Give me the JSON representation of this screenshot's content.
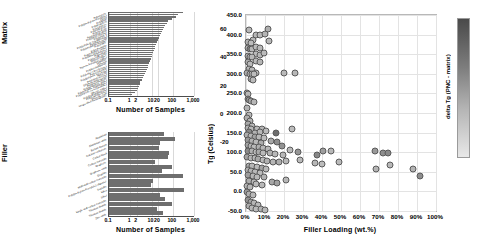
{
  "chart_data": [
    {
      "type": "bar",
      "orientation": "horizontal",
      "title": "Matrix",
      "xlabel": "Number of Samples",
      "ylabel": "Matrix",
      "xscale": "log",
      "xlim": [
        0.1,
        1000
      ],
      "xticks": [
        "0.1",
        "1",
        "2",
        "10",
        "20",
        "100",
        "1,000"
      ],
      "xtickvalues": [
        0.1,
        1,
        2,
        10,
        20,
        100,
        1000
      ],
      "grid": true,
      "bar_color": "#6e6e6e",
      "categories": [
        "Polystyrene",
        "Poly(methyl methacrylate)",
        "Epoxy",
        "Polyimide",
        "Polypropylene",
        "Polyethylene",
        "Polycarbonate",
        "Polyurethane",
        "Poly(vinyl alcohol)",
        "Poly(vinyl chloride)",
        "Polyamide 6",
        "Poly(ethylene terephthalate)",
        "Poly(lactic acid)",
        "Poly(vinylidene fluoride)",
        "Polyaniline",
        "Polyetherimide",
        "Poly(ethylene oxide)",
        "Poly(dimethylsiloxane)",
        "Polysulfone",
        "Poly(acrylic acid)",
        "Natural rubber",
        "Styrene-butadiene rubber",
        "Cellulose",
        "Chitosan",
        "Polybenzimidazole",
        "Poly(ether ether ketone)",
        "Polyacrylonitrile",
        "Poly(butylene succinate)",
        "Nylon 66",
        "Poly(vinyl acetate)",
        "Ethylene-vinyl acetate",
        "Polyphenylsulfone",
        "Poly(propylene oxide)",
        "Poly(ethylene naphthalate)",
        "Poly(styrene-co-acrylonitrile)",
        "Silicone rubber",
        "Poly(hydroxybutyrate)",
        "Poly(caprolactone)",
        "Phenolic resin",
        "Unspecified thermoplastic"
      ],
      "values": [
        310,
        170,
        150,
        95,
        60,
        55,
        44,
        38,
        33,
        30,
        27,
        24,
        22,
        20,
        18,
        16,
        15,
        14,
        13,
        12,
        11,
        10,
        9,
        8.5,
        8,
        7,
        6.5,
        6,
        5.5,
        5,
        4.5,
        4,
        3.5,
        3,
        2.8,
        2.5,
        2.2,
        2,
        1.6,
        1.2
      ]
    },
    {
      "type": "bar",
      "orientation": "horizontal",
      "title": "Filler",
      "xlabel": "Number of Samples",
      "ylabel": "Filler",
      "xscale": "log",
      "xlim": [
        0.1,
        1000
      ],
      "xticks": [
        "0.1",
        "1",
        "2",
        "10",
        "20",
        "100",
        "1,000"
      ],
      "xtickvalues": [
        0.1,
        1,
        2,
        10,
        20,
        100,
        1000
      ],
      "grid": true,
      "bar_color": "#6e6e6e",
      "categories": [
        "Aluminium",
        "Aluminium oxide",
        "Barium titanate",
        "Calcium carbonate",
        "Carbon black",
        "Carbon nanotube",
        "Graphene",
        "Graphene oxide",
        "Graphite",
        "Multi-wall carbon nanotube",
        "Poly(methyl methacrylate) oligomer",
        "Sepiolite",
        "Silica",
        "Silver",
        "Single-wall carbon nanotube",
        "Titanium dioxide",
        "Titanium dioxide",
        "Zinc oxide"
      ],
      "values": [
        40,
        130,
        26,
        22,
        70,
        60,
        14,
        95,
        30,
        300,
        12,
        9,
        330,
        24,
        45,
        95,
        18,
        35
      ]
    },
    {
      "type": "scatter",
      "title": "",
      "xlabel": "Filler Loading (wt.%)",
      "ylabel": "Tg (Celsius)",
      "xlim": [
        0,
        100
      ],
      "ylim": [
        -50,
        450
      ],
      "xticks": [
        "0%",
        "10%",
        "20%",
        "30%",
        "40%",
        "50%",
        "60%",
        "70%",
        "80%",
        "90%",
        "100%"
      ],
      "xtickvalues": [
        0,
        10,
        20,
        30,
        40,
        50,
        60,
        70,
        80,
        90,
        100
      ],
      "yticks": [
        "-50.0",
        "0.0",
        "50.0",
        "100.0",
        "150.0",
        "200.0",
        "250.0",
        "300.0",
        "350.0",
        "400.0",
        "450.0"
      ],
      "ytickvalues": [
        -50,
        0,
        50,
        100,
        150,
        200,
        250,
        300,
        350,
        400,
        450
      ],
      "grid": true,
      "colorbar": {
        "label": "delta Tg (PNC - matrix)",
        "ticks": [
          "60",
          "40",
          "20",
          "0",
          "-20"
        ],
        "tickvalues": [
          60,
          40,
          20,
          0,
          -20
        ],
        "vmin": -30,
        "vmax": 68,
        "colormap": "grayscale-dark-to-light"
      },
      "points": [
        {
          "x": 1.5,
          "y": 412,
          "c": 4
        },
        {
          "x": 3.5,
          "y": 385,
          "c": 2
        },
        {
          "x": 0.9,
          "y": 380,
          "c": 6
        },
        {
          "x": 2.6,
          "y": 378,
          "c": 1
        },
        {
          "x": 5.4,
          "y": 398,
          "c": 3
        },
        {
          "x": 7.6,
          "y": 399,
          "c": 2
        },
        {
          "x": 9.8,
          "y": 401,
          "c": 5
        },
        {
          "x": 11.5,
          "y": 414,
          "c": 8
        },
        {
          "x": 12.2,
          "y": 383,
          "c": 3
        },
        {
          "x": 1.0,
          "y": 366,
          "c": 7
        },
        {
          "x": 2.2,
          "y": 364,
          "c": 32
        },
        {
          "x": 3.4,
          "y": 362,
          "c": 4
        },
        {
          "x": 5.3,
          "y": 368,
          "c": 2
        },
        {
          "x": 7.4,
          "y": 366,
          "c": 3
        },
        {
          "x": 5.2,
          "y": 350,
          "c": 2
        },
        {
          "x": 7.3,
          "y": 349,
          "c": 4
        },
        {
          "x": 9.5,
          "y": 352,
          "c": 1
        },
        {
          "x": 0.8,
          "y": 346,
          "c": 10
        },
        {
          "x": 2.0,
          "y": 344,
          "c": 6
        },
        {
          "x": 3.2,
          "y": 342,
          "c": 3
        },
        {
          "x": 5.1,
          "y": 333,
          "c": 2
        },
        {
          "x": 7.2,
          "y": 331,
          "c": 5
        },
        {
          "x": 0.9,
          "y": 330,
          "c": 9
        },
        {
          "x": 2.1,
          "y": 326,
          "c": 2
        },
        {
          "x": 1.6,
          "y": 312,
          "c": 4
        },
        {
          "x": 3.0,
          "y": 310,
          "c": 3
        },
        {
          "x": 5.0,
          "y": 302,
          "c": 2
        },
        {
          "x": 0.7,
          "y": 302,
          "c": 12
        },
        {
          "x": 1.9,
          "y": 300,
          "c": 6
        },
        {
          "x": 3.1,
          "y": 299,
          "c": 3
        },
        {
          "x": 4.0,
          "y": 300,
          "c": 1
        },
        {
          "x": 20.0,
          "y": 302,
          "c": 2
        },
        {
          "x": 26.0,
          "y": 302,
          "c": 3
        },
        {
          "x": 2.4,
          "y": 288,
          "c": 8
        },
        {
          "x": 3.6,
          "y": 284,
          "c": 2
        },
        {
          "x": 0.6,
          "y": 252,
          "c": 5
        },
        {
          "x": 1.2,
          "y": 248,
          "c": 3
        },
        {
          "x": 0.8,
          "y": 236,
          "c": 18
        },
        {
          "x": 1.8,
          "y": 232,
          "c": 22
        },
        {
          "x": 2.6,
          "y": 230,
          "c": 14
        },
        {
          "x": 4.2,
          "y": 228,
          "c": 4
        },
        {
          "x": 0.5,
          "y": 214,
          "c": 6
        },
        {
          "x": 1.4,
          "y": 196,
          "c": 3
        },
        {
          "x": 0.7,
          "y": 186,
          "c": 9
        },
        {
          "x": 2.3,
          "y": 180,
          "c": 5
        },
        {
          "x": 1.1,
          "y": 172,
          "c": 12
        },
        {
          "x": 3.3,
          "y": 168,
          "c": 4
        },
        {
          "x": 0.9,
          "y": 162,
          "c": 7
        },
        {
          "x": 2.8,
          "y": 158,
          "c": 3
        },
        {
          "x": 5.6,
          "y": 160,
          "c": 2
        },
        {
          "x": 8.4,
          "y": 158,
          "c": 5
        },
        {
          "x": 1.6,
          "y": 152,
          "c": 30
        },
        {
          "x": 4.6,
          "y": 150,
          "c": 6
        },
        {
          "x": 7.2,
          "y": 152,
          "c": 3
        },
        {
          "x": 10.4,
          "y": 154,
          "c": 2
        },
        {
          "x": 15.6,
          "y": 148,
          "c": 44
        },
        {
          "x": 24.0,
          "y": 160,
          "c": 1
        },
        {
          "x": 0.6,
          "y": 144,
          "c": 9
        },
        {
          "x": 2.4,
          "y": 142,
          "c": 4
        },
        {
          "x": 4.8,
          "y": 140,
          "c": 16
        },
        {
          "x": 6.8,
          "y": 138,
          "c": 3
        },
        {
          "x": 9.6,
          "y": 136,
          "c": 2
        },
        {
          "x": 13.2,
          "y": 128,
          "c": 12
        },
        {
          "x": 16.4,
          "y": 126,
          "c": 26
        },
        {
          "x": 1.2,
          "y": 130,
          "c": 20
        },
        {
          "x": 3.2,
          "y": 128,
          "c": 6
        },
        {
          "x": 5.4,
          "y": 126,
          "c": 3
        },
        {
          "x": 7.8,
          "y": 124,
          "c": 10
        },
        {
          "x": 0.8,
          "y": 118,
          "c": 14
        },
        {
          "x": 2.8,
          "y": 116,
          "c": 5
        },
        {
          "x": 4.4,
          "y": 114,
          "c": 2
        },
        {
          "x": 6.6,
          "y": 112,
          "c": 8
        },
        {
          "x": 9.2,
          "y": 110,
          "c": 3
        },
        {
          "x": 11.8,
          "y": 108,
          "c": 4
        },
        {
          "x": 18.8,
          "y": 116,
          "c": 24
        },
        {
          "x": 1.0,
          "y": 104,
          "c": 28
        },
        {
          "x": 3.0,
          "y": 102,
          "c": 7
        },
        {
          "x": 5.0,
          "y": 100,
          "c": 3
        },
        {
          "x": 7.0,
          "y": 100,
          "c": 11
        },
        {
          "x": 9.0,
          "y": 98,
          "c": 2
        },
        {
          "x": 12.4,
          "y": 98,
          "c": 6
        },
        {
          "x": 15.0,
          "y": 96,
          "c": 4
        },
        {
          "x": 19.6,
          "y": 92,
          "c": 3
        },
        {
          "x": 23.0,
          "y": 106,
          "c": 2
        },
        {
          "x": 27.5,
          "y": 100,
          "c": 22
        },
        {
          "x": 37.5,
          "y": 92,
          "c": 30
        },
        {
          "x": 40.5,
          "y": 104,
          "c": 18
        },
        {
          "x": 44.5,
          "y": 104,
          "c": 3
        },
        {
          "x": 68.0,
          "y": 104,
          "c": 20
        },
        {
          "x": 72.0,
          "y": 98,
          "c": 26
        },
        {
          "x": 74.5,
          "y": 98,
          "c": 28
        },
        {
          "x": 0.6,
          "y": 88,
          "c": 16
        },
        {
          "x": 2.6,
          "y": 86,
          "c": 5
        },
        {
          "x": 4.6,
          "y": 84,
          "c": 3
        },
        {
          "x": 6.4,
          "y": 82,
          "c": 12
        },
        {
          "x": 8.8,
          "y": 80,
          "c": 2
        },
        {
          "x": 11.2,
          "y": 78,
          "c": 7
        },
        {
          "x": 14.4,
          "y": 76,
          "c": 4
        },
        {
          "x": 17.6,
          "y": 74,
          "c": 9
        },
        {
          "x": 21.0,
          "y": 78,
          "c": 3
        },
        {
          "x": 28.5,
          "y": 80,
          "c": 2
        },
        {
          "x": 36.5,
          "y": 72,
          "c": 4
        },
        {
          "x": 40.0,
          "y": 70,
          "c": 1
        },
        {
          "x": 49.0,
          "y": 74,
          "c": 2
        },
        {
          "x": 68.5,
          "y": 56,
          "c": 5
        },
        {
          "x": 76.0,
          "y": 68,
          "c": 3
        },
        {
          "x": 88.0,
          "y": 58,
          "c": 6
        },
        {
          "x": 91.5,
          "y": 40,
          "c": 26
        },
        {
          "x": 1.4,
          "y": 66,
          "c": 10
        },
        {
          "x": 3.4,
          "y": 64,
          "c": 4
        },
        {
          "x": 5.8,
          "y": 62,
          "c": 2
        },
        {
          "x": 8.2,
          "y": 60,
          "c": 14
        },
        {
          "x": 10.6,
          "y": 58,
          "c": 3
        },
        {
          "x": 0.8,
          "y": 54,
          "c": 8
        },
        {
          "x": 2.8,
          "y": 52,
          "c": 6
        },
        {
          "x": 4.8,
          "y": 50,
          "c": 3
        },
        {
          "x": 7.4,
          "y": 48,
          "c": 2
        },
        {
          "x": 1.0,
          "y": 42,
          "c": 18
        },
        {
          "x": 3.6,
          "y": 40,
          "c": 5
        },
        {
          "x": 6.0,
          "y": 38,
          "c": 3
        },
        {
          "x": 9.4,
          "y": 36,
          "c": 7
        },
        {
          "x": 13.8,
          "y": 24,
          "c": 12
        },
        {
          "x": 16.2,
          "y": 22,
          "c": 16
        },
        {
          "x": 20.8,
          "y": 28,
          "c": 4
        },
        {
          "x": 1.6,
          "y": 26,
          "c": 9
        },
        {
          "x": 4.2,
          "y": 24,
          "c": 3
        },
        {
          "x": 0.7,
          "y": 14,
          "c": 6
        },
        {
          "x": 2.2,
          "y": 12,
          "c": 4
        },
        {
          "x": 5.2,
          "y": 18,
          "c": 2
        },
        {
          "x": 8.6,
          "y": 16,
          "c": 3
        },
        {
          "x": 0.5,
          "y": -2,
          "c": 20
        },
        {
          "x": 1.8,
          "y": -6,
          "c": 8
        },
        {
          "x": 3.8,
          "y": -8,
          "c": 3
        },
        {
          "x": 0.9,
          "y": -22,
          "c": 24
        },
        {
          "x": 2.4,
          "y": -26,
          "c": 14
        },
        {
          "x": 4.4,
          "y": -30,
          "c": 5
        },
        {
          "x": 6.2,
          "y": -34,
          "c": 3
        },
        {
          "x": 1.4,
          "y": -38,
          "c": 10
        },
        {
          "x": 3.2,
          "y": -42,
          "c": 4
        },
        {
          "x": 5.0,
          "y": -44,
          "c": 2
        },
        {
          "x": 7.8,
          "y": -46,
          "c": 6
        },
        {
          "x": 10.2,
          "y": -47,
          "c": 3
        }
      ]
    }
  ]
}
